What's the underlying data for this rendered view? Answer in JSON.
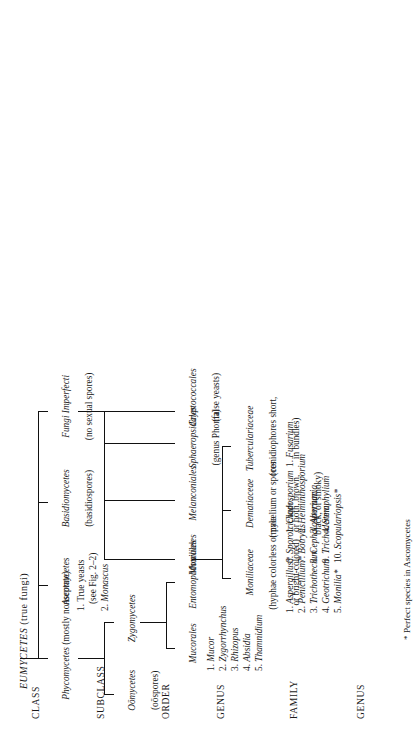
{
  "figure": {
    "title_italic": "EUMYCETES",
    "title_rest": " (true fungi)",
    "footnote": "* Perfect species in Ascomycetes"
  },
  "row_headers": [
    {
      "id": "class",
      "label": "CLASS"
    },
    {
      "id": "subclass",
      "label": "SUBCLASS"
    },
    {
      "id": "order",
      "label": "ORDER"
    },
    {
      "id": "genus1",
      "label": "GENUS"
    },
    {
      "id": "family",
      "label": "FAMILY"
    },
    {
      "id": "genus2",
      "label": "GENUS"
    }
  ],
  "nodes": {
    "phycomycetes": {
      "name": "Phycomycetes",
      "note": " (mostly nonseptate)"
    },
    "ascomycetes": {
      "name": "Ascomycetes",
      "note": ""
    },
    "basidiomycetes": {
      "name": "Basidiomycetes",
      "note": "(basidiospores)"
    },
    "fungi_imperfecti": {
      "name": "Fungi Imperfecti",
      "note": "(no sexual spores)"
    },
    "oomycetes": {
      "name": "Oömycetes",
      "note": "(oöspores)"
    },
    "zygomycetes": {
      "name": "Zygomycetes",
      "note": ""
    },
    "mucorales": {
      "name": "Mucorales",
      "note": ""
    },
    "entomophthorales": {
      "name": "Entomophthorales",
      "note": ""
    },
    "moniliales": {
      "name": "Moniliales",
      "note": ""
    },
    "melanconiales": {
      "name": "Melanconiales",
      "note": ""
    },
    "sphaeropsidales": {
      "name": "Sphaeropsidales",
      "note": "(genus Phoma)"
    },
    "cryptococcales": {
      "name": "Cryptococcales",
      "note": "(false yeasts)"
    },
    "moniliaceae": {
      "name": "Moniliaceae",
      "note_line1": "(hyphae colorless or pale",
      "note_line2": "or bright-colored)"
    },
    "dematiaceae": {
      "name": "Dematiaceae",
      "note_line1": "(mycelium or spores",
      "note_line2": "or both, brown,",
      "note_line3": "black, or smoky)"
    },
    "tuberculariaceae": {
      "name": "Tuberculariaceae",
      "note_line1": "(conidiophores short,",
      "note_line2": "in bundles)"
    }
  },
  "lists": {
    "ascomycetes_items": [
      {
        "n": "1.",
        "text": "True yeasts",
        "italic": false
      },
      {
        "n": "",
        "text": "(see Fig. 2–2)",
        "italic": false
      },
      {
        "n": "2.",
        "text": "Monascus",
        "italic": true
      }
    ],
    "mucorales_genera": [
      {
        "n": "1.",
        "text": "Mucor"
      },
      {
        "n": "2.",
        "text": "Zygorrhynchus"
      },
      {
        "n": "3.",
        "text": "Rhizopus"
      },
      {
        "n": "4.",
        "text": "Absidia"
      },
      {
        "n": "5.",
        "text": "Thamnidium"
      }
    ],
    "moniliaceae_genera_col1": [
      {
        "n": "1.",
        "text": "Aspergillus*"
      },
      {
        "n": "2.",
        "text": "Penicillium*"
      },
      {
        "n": "3.",
        "text": "Trichothecium"
      },
      {
        "n": "4.",
        "text": "Geotrichum"
      },
      {
        "n": "5.",
        "text": "Monilia*"
      }
    ],
    "moniliaceae_genera_col2": [
      {
        "n": "6.",
        "text": "Sporotrichum"
      },
      {
        "n": "7.",
        "text": "Botrytis"
      },
      {
        "n": "8.",
        "text": "Cephalosporium"
      },
      {
        "n": "9.",
        "text": "Trichoderma"
      },
      {
        "n": "10.",
        "text": "Scopulariopsis*"
      }
    ],
    "dematiaceae_genera": [
      {
        "n": "1.",
        "text": "Cladosporium"
      },
      {
        "n": "2.",
        "text": "Helminthosporium"
      },
      {
        "n": "3.",
        "text": "Alternaria"
      },
      {
        "n": "4.",
        "text": "Stemphylium"
      }
    ],
    "tuberculariaceae_genera": [
      {
        "n": "1.",
        "text": "Fusarium"
      }
    ]
  }
}
